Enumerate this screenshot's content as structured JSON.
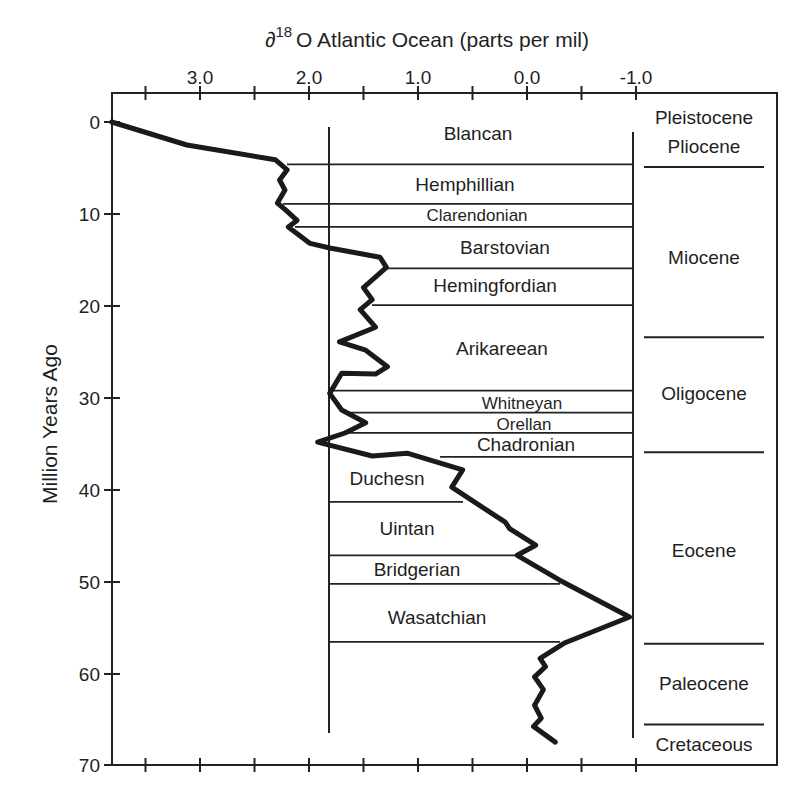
{
  "chart_data": {
    "type": "line",
    "title": "",
    "xlabel": "∂18O Atlantic Ocean (parts per mil)",
    "xlabel_parts": {
      "symbol": "∂",
      "superscript": "18",
      "rest": "O Atlantic Ocean (parts per mil)"
    },
    "ylabel": "Million Years Ago",
    "x_axis_position": "top",
    "x_reversed": true,
    "y_reversed": true,
    "xlim": [
      3.8,
      -1.0
    ],
    "ylim": [
      0,
      70
    ],
    "grid": false,
    "legend": null,
    "x_ticks": [
      {
        "value": 3.5,
        "label": ""
      },
      {
        "value": 3.0,
        "label": "3.0"
      },
      {
        "value": 2.5,
        "label": ""
      },
      {
        "value": 2.0,
        "label": "2.0"
      },
      {
        "value": 1.5,
        "label": ""
      },
      {
        "value": 1.0,
        "label": "1.0"
      },
      {
        "value": 0.5,
        "label": ""
      },
      {
        "value": 0.0,
        "label": "0.0"
      },
      {
        "value": -0.5,
        "label": ""
      },
      {
        "value": -1.0,
        "label": "-1.0"
      }
    ],
    "y_ticks": [
      {
        "value": 0,
        "label": "0"
      },
      {
        "value": 10,
        "label": "10"
      },
      {
        "value": 20,
        "label": "20"
      },
      {
        "value": 30,
        "label": "30"
      },
      {
        "value": 40,
        "label": "40"
      },
      {
        "value": 50,
        "label": "50"
      },
      {
        "value": 60,
        "label": "60"
      },
      {
        "value": 70,
        "label": "70"
      }
    ],
    "series": [
      {
        "name": "∂18O Atlantic Ocean",
        "points": [
          [
            3.81,
            0.0
          ],
          [
            3.12,
            2.5
          ],
          [
            2.31,
            4.1
          ],
          [
            2.2,
            5.2
          ],
          [
            2.27,
            6.3
          ],
          [
            2.22,
            7.4
          ],
          [
            2.29,
            8.8
          ],
          [
            2.21,
            9.6
          ],
          [
            2.11,
            10.7
          ],
          [
            2.19,
            11.4
          ],
          [
            1.99,
            13.2
          ],
          [
            1.81,
            13.7
          ],
          [
            1.35,
            14.7
          ],
          [
            1.29,
            15.8
          ],
          [
            1.5,
            18.0
          ],
          [
            1.42,
            19.3
          ],
          [
            1.53,
            20.4
          ],
          [
            1.39,
            22.3
          ],
          [
            1.72,
            23.9
          ],
          [
            1.48,
            24.8
          ],
          [
            1.28,
            26.6
          ],
          [
            1.39,
            27.4
          ],
          [
            1.7,
            27.3
          ],
          [
            1.81,
            29.5
          ],
          [
            1.7,
            31.3
          ],
          [
            1.48,
            32.7
          ],
          [
            1.67,
            33.8
          ],
          [
            1.92,
            34.8
          ],
          [
            1.42,
            36.3
          ],
          [
            1.1,
            36.0
          ],
          [
            0.59,
            37.8
          ],
          [
            0.69,
            39.7
          ],
          [
            0.2,
            43.5
          ],
          [
            0.16,
            44.2
          ],
          [
            -0.08,
            46.0
          ],
          [
            0.09,
            47.1
          ],
          [
            -0.3,
            49.8
          ],
          [
            -0.94,
            53.8
          ],
          [
            -0.35,
            56.6
          ],
          [
            -0.12,
            58.3
          ],
          [
            -0.17,
            59.2
          ],
          [
            -0.07,
            60.3
          ],
          [
            -0.15,
            61.7
          ],
          [
            -0.07,
            63.4
          ],
          [
            -0.13,
            64.8
          ],
          [
            -0.06,
            65.7
          ],
          [
            -0.26,
            67.4
          ]
        ]
      }
    ],
    "land_mammal_ages": [
      {
        "name": "Blancan",
        "top": 0.6,
        "bottom": 4.6,
        "label_x": 478,
        "label_y": 133,
        "line_start_x": 287
      },
      {
        "name": "Hemphillian",
        "top": 4.6,
        "bottom": 8.9,
        "label_x": 465,
        "label_y": 184,
        "line_start_x": 283
      },
      {
        "name": "Clarendonian",
        "top": 8.9,
        "bottom": 11.4,
        "label_x": 477,
        "label_y": 214,
        "line_start_x": 295,
        "small": true
      },
      {
        "name": "Barstovian",
        "top": 11.4,
        "bottom": 15.9,
        "label_x": 505,
        "label_y": 247,
        "line_start_x": 385
      },
      {
        "name": "Hemingfordian",
        "top": 15.9,
        "bottom": 19.9,
        "label_x": 495,
        "label_y": 285,
        "line_start_x": 372
      },
      {
        "name": "Arikareean",
        "top": 19.9,
        "bottom": 29.2,
        "label_x": 502,
        "label_y": 348,
        "line_start_x": 331
      },
      {
        "name": "Whitneyan",
        "top": 29.2,
        "bottom": 31.6,
        "label_x": 522,
        "label_y": 402,
        "line_start_x": 345,
        "small": true
      },
      {
        "name": "Orellan",
        "top": 31.6,
        "bottom": 33.8,
        "label_x": 524,
        "label_y": 423,
        "line_start_x": 345,
        "small": true
      },
      {
        "name": "Chadronian",
        "top": 33.8,
        "bottom": 36.4,
        "label_x": 526,
        "label_y": 444,
        "line_start_x": 440
      },
      {
        "name": "Duchesn",
        "top": 36.4,
        "bottom": 41.3,
        "label_x": 387,
        "label_y": 478,
        "line_end_x": 463
      },
      {
        "name": "Uintan",
        "top": 41.3,
        "bottom": 47.1,
        "label_x": 407,
        "label_y": 528,
        "line_end_x": 515
      },
      {
        "name": "Bridgerian",
        "top": 47.1,
        "bottom": 50.2,
        "label_x": 417,
        "label_y": 569,
        "line_end_x": 560
      },
      {
        "name": "Wasatchian",
        "top": 50.2,
        "bottom": 56.5,
        "label_x": 437,
        "label_y": 617,
        "line_end_x": 560
      }
    ],
    "epochs": [
      {
        "name": "Pleistocene",
        "label_y": 117
      },
      {
        "name": "Pliocene",
        "label_y": 146
      },
      {
        "name": "Miocene",
        "label_y": 257
      },
      {
        "name": "Oligocene",
        "label_y": 393
      },
      {
        "name": "Eocene",
        "label_y": 550
      },
      {
        "name": "Paleocene",
        "label_y": 683
      },
      {
        "name": "Cretaceous",
        "label_y": 744
      }
    ],
    "epoch_boundaries_ma": [
      4.9,
      23.4,
      35.9,
      56.7,
      65.5
    ],
    "colors": {
      "line": "#1a1a1a",
      "frame": "#222222",
      "text": "#1f1f1f",
      "background": "#ffffff"
    }
  }
}
